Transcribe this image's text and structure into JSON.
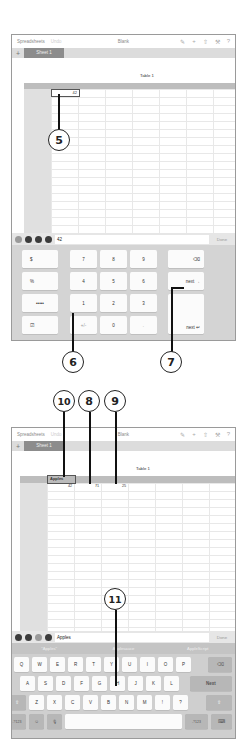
{
  "screen1": {
    "titlebar": {
      "back_label": "Spreadsheets",
      "undo_label": "Undo",
      "doc_title": "Blank",
      "icons": [
        "brush-icon",
        "plus-icon",
        "share-icon",
        "wrench-icon",
        "help-icon"
      ]
    },
    "tabs": {
      "add_label": "+",
      "sheet_label": "Sheet 1"
    },
    "table": {
      "title": "Table 1",
      "selected_cell_value": "42"
    },
    "formula_bar": {
      "buttons": [
        "recent-icon",
        "number-keypad-icon",
        "text-keyboard-icon",
        "formula-icon"
      ],
      "value": "42",
      "done_label": "Done"
    },
    "numpad": {
      "left_keys": [
        "$",
        "%",
        "•••••",
        "☑"
      ],
      "digits": [
        [
          "7",
          "8",
          "9"
        ],
        [
          "4",
          "5",
          "6"
        ],
        [
          "1",
          "2",
          "3"
        ],
        [
          "+/-",
          "0",
          "."
        ]
      ],
      "delete_label": "⌫",
      "next_label": "next →",
      "return_label": "next ↵"
    },
    "callouts": [
      "5",
      "6",
      "7"
    ]
  },
  "screen2": {
    "titlebar": {
      "back_label": "Spreadsheets",
      "undo_label": "Undo",
      "doc_title": "Blank",
      "icons": [
        "brush-icon",
        "plus-icon",
        "share-icon",
        "wrench-icon",
        "help-icon"
      ]
    },
    "tabs": {
      "add_label": "+",
      "sheet_label": "Sheet 1"
    },
    "table": {
      "title": "Table 1",
      "selected_cell_value": "Apples",
      "row_values": [
        "42",
        "71",
        "25"
      ]
    },
    "formula_bar": {
      "buttons": [
        "recent-icon",
        "number-keypad-icon",
        "text-keyboard-icon",
        "formula-icon"
      ],
      "value": "Apples",
      "done_label": "Done"
    },
    "suggestions": [
      "\"Apples\"",
      "Applesauce",
      "AppleScript"
    ],
    "keyboard": {
      "row1": [
        "Q",
        "W",
        "E",
        "R",
        "T",
        "Y",
        "U",
        "I",
        "O",
        "P"
      ],
      "row2": [
        "A",
        "S",
        "D",
        "F",
        "G",
        "H",
        "J",
        "K",
        "L"
      ],
      "row3": [
        "Z",
        "X",
        "C",
        "V",
        "B",
        "N",
        "M",
        "!",
        "?"
      ],
      "next_label": "Next",
      "num_label": ".?123",
      "delete_label": "⌫",
      "shift_label": "⇧",
      "emoji_label": "☺",
      "mic_label": "🎙",
      "hide_label": "⌨"
    },
    "callouts": [
      "10",
      "8",
      "9",
      "11"
    ]
  }
}
